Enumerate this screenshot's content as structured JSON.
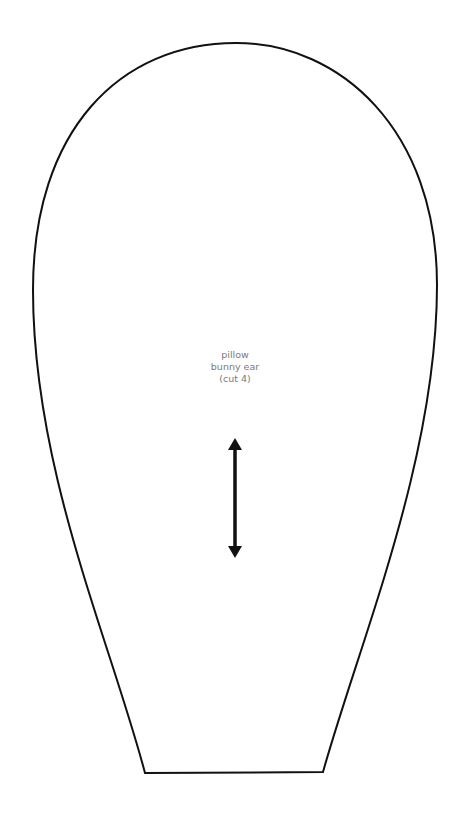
{
  "pattern": {
    "piece_name_line1": "pillow",
    "piece_name_line2": "bunny ear",
    "cut_instruction": "(cut 4)",
    "grainline": "double-headed vertical arrow",
    "outline_color": "#111111",
    "label_color": "#7a7a7a"
  }
}
